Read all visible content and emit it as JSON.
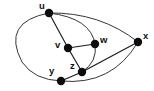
{
  "figure": {
    "kind": "undirected-graph-drawing",
    "width": 154,
    "height": 91,
    "background_color": "#ffffff",
    "edge_color": "#1a1a1a",
    "node_color": "#0d0d0d",
    "label_color": "#111111",
    "node_radius": 4.2
  },
  "graph": {
    "vertex_labels": [
      "u",
      "v",
      "w",
      "x",
      "y",
      "z"
    ],
    "vertices": [
      {
        "id": "u",
        "label": "u",
        "cx": 49,
        "cy": 13,
        "label_x": 39,
        "label_y": 1
      },
      {
        "id": "v",
        "label": "v",
        "cx": 68,
        "cy": 48,
        "label_x": 55,
        "label_y": 40
      },
      {
        "id": "w",
        "label": "w",
        "cx": 95,
        "cy": 44,
        "label_x": 100,
        "label_y": 35
      },
      {
        "id": "x",
        "label": "x",
        "cx": 138,
        "cy": 42,
        "label_x": 143,
        "label_y": 31
      },
      {
        "id": "y",
        "label": "y",
        "cx": 61,
        "cy": 81,
        "label_x": 49,
        "label_y": 66
      },
      {
        "id": "z",
        "label": "z",
        "cx": 82,
        "cy": 72,
        "label_x": 70,
        "label_y": 61
      }
    ],
    "edges": [
      {
        "from": "u",
        "to": "v",
        "shape": "line",
        "path": "M 49 13 L 68 48"
      },
      {
        "from": "u",
        "to": "x",
        "shape": "curve",
        "path": "M 49 13 Q 100 12 138 42"
      },
      {
        "from": "u",
        "to": "y",
        "shape": "curve",
        "path": "M 49 13 Q 1 22 22 62 Q 34 80 61 81"
      },
      {
        "from": "u",
        "to": "w",
        "shape": "curve",
        "path": "M 49 13 Q 91 18 95 44"
      },
      {
        "from": "v",
        "to": "w",
        "shape": "line",
        "path": "M 68 48 L 95 44"
      },
      {
        "from": "v",
        "to": "z",
        "shape": "line",
        "path": "M 68 48 L 82 72"
      },
      {
        "from": "w",
        "to": "z",
        "shape": "curve",
        "path": "M 95 44 Q 98 62 82 72"
      },
      {
        "from": "y",
        "to": "z",
        "shape": "line",
        "path": "M 61 81 L 82 72"
      },
      {
        "from": "y",
        "to": "x",
        "shape": "curve",
        "path": "M 61 81 Q 112 86 138 42"
      },
      {
        "from": "z",
        "to": "x",
        "shape": "line",
        "path": "M 82 72 L 138 42"
      }
    ]
  }
}
